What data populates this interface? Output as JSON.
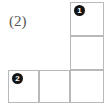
{
  "figure": {
    "label": "(2)",
    "shape_name": "L-shaped polyomino",
    "cell_count": 5,
    "line_color": "#b9b9b9",
    "background_color": "#ffffff",
    "label_color": "#555555",
    "marker_fill_color": "#141414",
    "marker_text_color": "#ffffff",
    "cells": [
      {
        "id": "cell-r1c3",
        "row": 1,
        "col": 3,
        "x": 70,
        "y": 2,
        "w": 34,
        "h": 34
      },
      {
        "id": "cell-r2c3",
        "row": 2,
        "col": 3,
        "x": 70,
        "y": 36,
        "w": 34,
        "h": 34
      },
      {
        "id": "cell-r3c1",
        "row": 3,
        "col": 1,
        "x": 8,
        "y": 70,
        "w": 31,
        "h": 33
      },
      {
        "id": "cell-r3c2",
        "row": 3,
        "col": 2,
        "x": 39,
        "y": 70,
        "w": 31,
        "h": 33
      },
      {
        "id": "cell-r3c3",
        "row": 3,
        "col": 3,
        "x": 70,
        "y": 70,
        "w": 34,
        "h": 33
      }
    ],
    "markers": [
      {
        "id": "marker-1",
        "text": "1",
        "in_cell": "cell-r1c3",
        "x": 74,
        "y": 5
      },
      {
        "id": "marker-2",
        "text": "2",
        "in_cell": "cell-r3c1",
        "x": 12,
        "y": 73
      }
    ]
  }
}
